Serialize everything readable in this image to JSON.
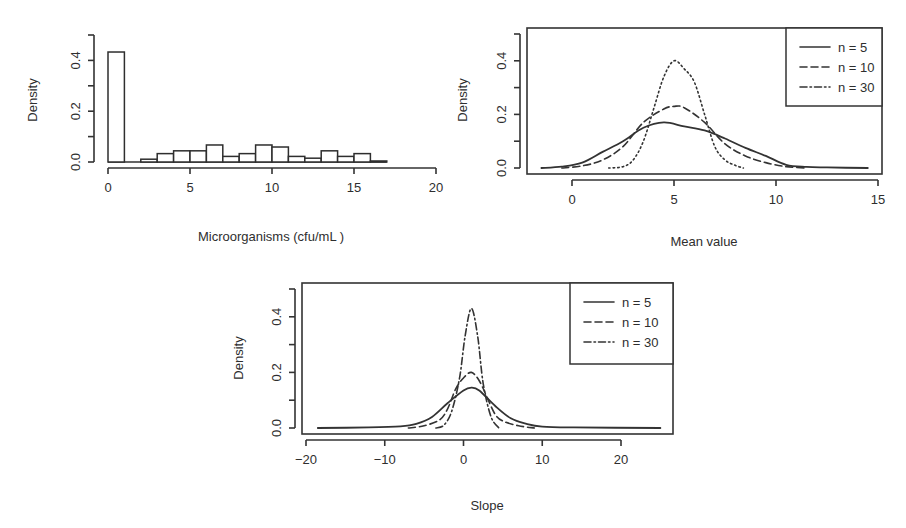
{
  "chart_data": [
    {
      "id": "histogram",
      "type": "bar",
      "subtype": "histogram",
      "title": "",
      "xlabel": "Microorganisms (cfu/mL )",
      "ylabel": "Density",
      "xlim": [
        0,
        20
      ],
      "ylim": [
        0,
        0.5
      ],
      "xticks": [
        0,
        5,
        10,
        15,
        20
      ],
      "xtick_labels": [
        "0",
        "5",
        "10",
        "15",
        "20"
      ],
      "yticks": [
        0,
        0.1,
        0.2,
        0.3,
        0.4,
        0.5
      ],
      "ytick_labels": [
        "0.0",
        "",
        "0.2",
        "",
        "0.4",
        ""
      ],
      "grid": false,
      "bins": [
        {
          "x0": 0,
          "x1": 1,
          "density": 0.433
        },
        {
          "x0": 1,
          "x1": 2,
          "density": 0.0
        },
        {
          "x0": 2,
          "x1": 3,
          "density": 0.011
        },
        {
          "x0": 3,
          "x1": 4,
          "density": 0.033
        },
        {
          "x0": 4,
          "x1": 5,
          "density": 0.044
        },
        {
          "x0": 5,
          "x1": 6,
          "density": 0.044
        },
        {
          "x0": 6,
          "x1": 7,
          "density": 0.067
        },
        {
          "x0": 7,
          "x1": 8,
          "density": 0.022
        },
        {
          "x0": 8,
          "x1": 9,
          "density": 0.033
        },
        {
          "x0": 9,
          "x1": 10,
          "density": 0.067
        },
        {
          "x0": 10,
          "x1": 11,
          "density": 0.059
        },
        {
          "x0": 11,
          "x1": 12,
          "density": 0.022
        },
        {
          "x0": 12,
          "x1": 13,
          "density": 0.015
        },
        {
          "x0": 13,
          "x1": 14,
          "density": 0.044
        },
        {
          "x0": 14,
          "x1": 15,
          "density": 0.022
        },
        {
          "x0": 15,
          "x1": 16,
          "density": 0.033
        },
        {
          "x0": 16,
          "x1": 17,
          "density": 0.004
        }
      ]
    },
    {
      "id": "mean-density",
      "type": "line",
      "title": "",
      "xlabel": "Mean value",
      "ylabel": "Density",
      "xlim": [
        -2,
        15
      ],
      "ylim": [
        0,
        0.5
      ],
      "xticks": [
        0,
        5,
        10,
        15
      ],
      "xtick_labels": [
        "0",
        "5",
        "10",
        "15"
      ],
      "yticks": [
        0,
        0.1,
        0.2,
        0.3,
        0.4,
        0.5
      ],
      "ytick_labels": [
        "0.0",
        "",
        "0.2",
        "",
        "0.4",
        ""
      ],
      "grid": false,
      "legend_position": "topright",
      "series": [
        {
          "name": "n = 5",
          "dash": "solid",
          "x": [
            -1.5,
            -0.5,
            0.5,
            1.5,
            2.5,
            3.5,
            4.5,
            5.5,
            6.5,
            7.5,
            8.5,
            9.5,
            10.5,
            11.5,
            12.5,
            14.5
          ],
          "y": [
            0.0,
            0.005,
            0.02,
            0.06,
            0.1,
            0.15,
            0.17,
            0.155,
            0.14,
            0.11,
            0.075,
            0.045,
            0.012,
            0.004,
            0.002,
            0.0
          ]
        },
        {
          "name": "n = 10",
          "dash": "dashed",
          "x": [
            -0.5,
            0.5,
            1.5,
            2.5,
            3.5,
            4.5,
            5.0,
            5.5,
            6.5,
            7.5,
            8.5,
            9.5,
            10.5,
            11.5
          ],
          "y": [
            0.0,
            0.008,
            0.03,
            0.08,
            0.17,
            0.22,
            0.23,
            0.225,
            0.17,
            0.09,
            0.045,
            0.02,
            0.005,
            0.0
          ]
        },
        {
          "name": "n = 30",
          "dash": "dotted",
          "x": [
            1.8,
            2.5,
            3.0,
            3.5,
            4.0,
            4.5,
            5.0,
            5.5,
            6.0,
            6.5,
            7.0,
            7.5,
            8.0,
            8.4
          ],
          "y": [
            0.0,
            0.005,
            0.03,
            0.1,
            0.22,
            0.34,
            0.4,
            0.37,
            0.32,
            0.2,
            0.08,
            0.03,
            0.01,
            0.0
          ]
        }
      ]
    },
    {
      "id": "slope-density",
      "type": "line",
      "title": "",
      "xlabel": "Slope",
      "ylabel": "Density",
      "xlim": [
        -20,
        26
      ],
      "ylim": [
        0,
        0.5
      ],
      "xticks": [
        -20,
        -10,
        0,
        10,
        20
      ],
      "xtick_labels": [
        "−20",
        "−10",
        "0",
        "10",
        "20"
      ],
      "yticks": [
        0,
        0.1,
        0.2,
        0.3,
        0.4,
        0.5
      ],
      "ytick_labels": [
        "0.0",
        "",
        "0.2",
        "",
        "0.4",
        ""
      ],
      "grid": false,
      "legend_position": "topright",
      "series": [
        {
          "name": "n = 5",
          "dash": "solid",
          "x": [
            -18.5,
            -12,
            -8,
            -6,
            -4,
            -2,
            0,
            1,
            2,
            4,
            6,
            8,
            10,
            14,
            25
          ],
          "y": [
            0.0,
            0.002,
            0.006,
            0.015,
            0.04,
            0.09,
            0.135,
            0.145,
            0.135,
            0.08,
            0.035,
            0.015,
            0.005,
            0.002,
            0.0
          ]
        },
        {
          "name": "n = 10",
          "dash": "dashed",
          "x": [
            -7,
            -5,
            -3,
            -2,
            -1,
            0,
            1,
            2,
            3,
            4,
            5,
            7,
            9
          ],
          "y": [
            0.0,
            0.008,
            0.03,
            0.07,
            0.14,
            0.18,
            0.2,
            0.17,
            0.11,
            0.05,
            0.025,
            0.008,
            0.0
          ]
        },
        {
          "name": "n = 30",
          "dash": "dotdash",
          "x": [
            -3.5,
            -2.5,
            -1.5,
            -0.5,
            0.2,
            1.0,
            1.8,
            2.5,
            3.5,
            4.5
          ],
          "y": [
            0.0,
            0.01,
            0.06,
            0.18,
            0.33,
            0.43,
            0.33,
            0.16,
            0.04,
            0.0
          ]
        }
      ]
    }
  ]
}
